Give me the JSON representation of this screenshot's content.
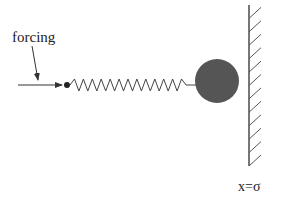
{
  "diagram": {
    "type": "mass-spring-wall",
    "labels": {
      "forcing": "forcing",
      "wall_position": "x=σ"
    },
    "colors": {
      "background": "#ffffff",
      "stroke": "#333333",
      "mass_fill": "#555555",
      "wall": "#555555"
    },
    "elements": {
      "forcing_arrow": {
        "from": [
          18,
          85
        ],
        "to": [
          62,
          85
        ]
      },
      "label_pointer": {
        "from": [
          32,
          46
        ],
        "to": [
          38,
          80
        ]
      },
      "driver_dot": {
        "cx": 67,
        "cy": 85,
        "r": 3
      },
      "spring": {
        "x_start": 70,
        "x_end": 186,
        "y": 85,
        "peaks": 13,
        "amplitude": 6
      },
      "mass": {
        "cx": 217,
        "cy": 81,
        "r": 22
      },
      "wall": {
        "x": 249,
        "y_top": 5,
        "y_bottom": 166,
        "hatch_count": 12
      }
    }
  }
}
